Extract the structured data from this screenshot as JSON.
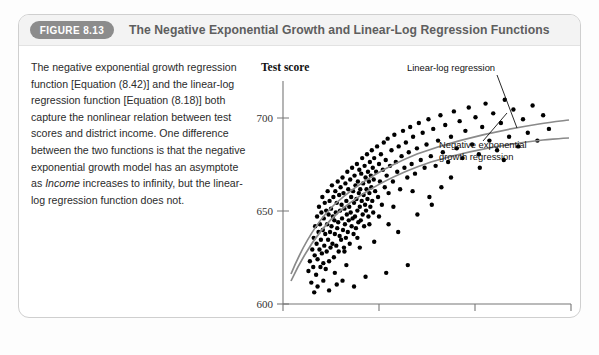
{
  "figure": {
    "badge": "FIGURE 8.13",
    "title": "The Negative Exponential Growth and Linear-Log Regression Functions",
    "caption_text": "The negative exponential growth regression function [Equation (8.42)] and the linear-log regression function [Equation (8.18)] both capture the nonlinear relation between test scores and district income. One difference between the two functions is that the negative exponential growth model has an asymptote as ",
    "caption_italic": "Income",
    "caption_text_2": " increases to infinity, but the linear-log regression function does not."
  },
  "colors": {
    "badge_bg": "#8c8c8c",
    "header_bg": "#f3f3f3",
    "panel_border": "#cfcfcf",
    "point": "#000000",
    "curve": "#8a8a8a",
    "axis": "#555555"
  },
  "chart_data": {
    "type": "scatter",
    "title": "",
    "xlabel": "District income",
    "ylabel": "Test score",
    "xlim": [
      0,
      60
    ],
    "ylim": [
      600,
      710
    ],
    "xticks": [
      0,
      20,
      40,
      60
    ],
    "yticks": [
      600,
      650,
      700
    ],
    "grid": false,
    "legend_position": "in-plot-annotations",
    "annotations": [
      {
        "name": "linear-log-regression",
        "label": "Linear-log regression"
      },
      {
        "name": "negative-exponential-growth-regression",
        "label": "Negative exponential growth regression"
      }
    ],
    "series": [
      {
        "name": "Districts",
        "type": "scatter",
        "points": [
          [
            5.3,
            617
          ],
          [
            5.6,
            622
          ],
          [
            5.9,
            611
          ],
          [
            6.1,
            628
          ],
          [
            6.3,
            619
          ],
          [
            6.4,
            634
          ],
          [
            6.6,
            625
          ],
          [
            6.7,
            640
          ],
          [
            6.9,
            615
          ],
          [
            7.0,
            631
          ],
          [
            7.1,
            645
          ],
          [
            7.2,
            623
          ],
          [
            7.4,
            637
          ],
          [
            7.5,
            650
          ],
          [
            7.6,
            628
          ],
          [
            7.7,
            641
          ],
          [
            7.8,
            619
          ],
          [
            7.9,
            633
          ],
          [
            8.0,
            647
          ],
          [
            8.1,
            626
          ],
          [
            8.2,
            655
          ],
          [
            8.3,
            638
          ],
          [
            8.4,
            621
          ],
          [
            8.5,
            644
          ],
          [
            8.6,
            630
          ],
          [
            8.7,
            652
          ],
          [
            8.8,
            636
          ],
          [
            8.9,
            618
          ],
          [
            9.0,
            648
          ],
          [
            9.1,
            627
          ],
          [
            9.2,
            641
          ],
          [
            9.3,
            658
          ],
          [
            9.4,
            633
          ],
          [
            9.5,
            646
          ],
          [
            9.6,
            622
          ],
          [
            9.7,
            653
          ],
          [
            9.8,
            637
          ],
          [
            9.9,
            629
          ],
          [
            10.0,
            649
          ],
          [
            10.1,
            640
          ],
          [
            10.2,
            661
          ],
          [
            10.3,
            631
          ],
          [
            10.4,
            645
          ],
          [
            10.5,
            655
          ],
          [
            10.6,
            624
          ],
          [
            10.7,
            643
          ],
          [
            10.8,
            636
          ],
          [
            10.9,
            658
          ],
          [
            11.0,
            647
          ],
          [
            11.1,
            630
          ],
          [
            11.2,
            652
          ],
          [
            11.3,
            639
          ],
          [
            11.4,
            663
          ],
          [
            11.5,
            642
          ],
          [
            11.6,
            627
          ],
          [
            11.7,
            656
          ],
          [
            11.8,
            635
          ],
          [
            11.9,
            648
          ],
          [
            12.0,
            660
          ],
          [
            12.1,
            633
          ],
          [
            12.2,
            651
          ],
          [
            12.3,
            644
          ],
          [
            12.4,
            665
          ],
          [
            12.5,
            638
          ],
          [
            12.6,
            657
          ],
          [
            12.7,
            629
          ],
          [
            12.8,
            649
          ],
          [
            12.9,
            641
          ],
          [
            13.0,
            662
          ],
          [
            13.1,
            634
          ],
          [
            13.2,
            653
          ],
          [
            13.3,
            646
          ],
          [
            13.4,
            668
          ],
          [
            13.5,
            637
          ],
          [
            13.6,
            659
          ],
          [
            13.7,
            643
          ],
          [
            13.8,
            650
          ],
          [
            13.9,
            631
          ],
          [
            14.0,
            664
          ],
          [
            14.1,
            647
          ],
          [
            14.2,
            655
          ],
          [
            14.3,
            640
          ],
          [
            14.4,
            670
          ],
          [
            14.5,
            644
          ],
          [
            14.6,
            658
          ],
          [
            14.7,
            636
          ],
          [
            14.8,
            652
          ],
          [
            14.9,
            666
          ],
          [
            15.0,
            645
          ],
          [
            15.1,
            661
          ],
          [
            15.2,
            639
          ],
          [
            15.3,
            654
          ],
          [
            15.4,
            672
          ],
          [
            15.5,
            648
          ],
          [
            15.6,
            663
          ],
          [
            15.7,
            642
          ],
          [
            15.8,
            657
          ],
          [
            15.9,
            669
          ],
          [
            16.0,
            650
          ],
          [
            16.1,
            659
          ],
          [
            16.2,
            643
          ],
          [
            16.3,
            667
          ],
          [
            16.4,
            653
          ],
          [
            16.5,
            675
          ],
          [
            16.6,
            646
          ],
          [
            16.7,
            662
          ],
          [
            16.8,
            656
          ],
          [
            16.9,
            640
          ],
          [
            17.0,
            671
          ],
          [
            17.1,
            651
          ],
          [
            17.2,
            665
          ],
          [
            17.3,
            648
          ],
          [
            17.4,
            659
          ],
          [
            17.5,
            677
          ],
          [
            17.6,
            654
          ],
          [
            17.7,
            668
          ],
          [
            17.8,
            645
          ],
          [
            17.9,
            663
          ],
          [
            18.0,
            657
          ],
          [
            18.1,
            673
          ],
          [
            18.2,
            650
          ],
          [
            18.3,
            666
          ],
          [
            18.4,
            660
          ],
          [
            18.5,
            679
          ],
          [
            18.6,
            653
          ],
          [
            18.7,
            670
          ],
          [
            18.8,
            647
          ],
          [
            18.9,
            664
          ],
          [
            19.0,
            675
          ],
          [
            19.2,
            658
          ],
          [
            19.4,
            668
          ],
          [
            19.6,
            681
          ],
          [
            19.8,
            655
          ],
          [
            20.0,
            672
          ],
          [
            20.2,
            663
          ],
          [
            20.4,
            677
          ],
          [
            20.6,
            651
          ],
          [
            20.8,
            669
          ],
          [
            21.0,
            683
          ],
          [
            21.2,
            660
          ],
          [
            21.4,
            674
          ],
          [
            21.6,
            666
          ],
          [
            21.8,
            685
          ],
          [
            22.0,
            657
          ],
          [
            22.3,
            671
          ],
          [
            22.6,
            679
          ],
          [
            22.9,
            663
          ],
          [
            23.2,
            687
          ],
          [
            23.5,
            673
          ],
          [
            23.8,
            668
          ],
          [
            24.1,
            681
          ],
          [
            24.4,
            659
          ],
          [
            24.7,
            676
          ],
          [
            25.0,
            689
          ],
          [
            25.3,
            670
          ],
          [
            25.6,
            683
          ],
          [
            25.9,
            665
          ],
          [
            26.2,
            678
          ],
          [
            26.5,
            691
          ],
          [
            26.8,
            672
          ],
          [
            27.1,
            686
          ],
          [
            27.5,
            667
          ],
          [
            27.9,
            680
          ],
          [
            28.3,
            693
          ],
          [
            28.7,
            674
          ],
          [
            29.1,
            688
          ],
          [
            29.5,
            670
          ],
          [
            29.9,
            682
          ],
          [
            30.3,
            695
          ],
          [
            30.8,
            676
          ],
          [
            31.3,
            690
          ],
          [
            31.8,
            671
          ],
          [
            32.3,
            684
          ],
          [
            32.8,
            697
          ],
          [
            33.3,
            678
          ],
          [
            33.8,
            692
          ],
          [
            34.4,
            673
          ],
          [
            35.0,
            686
          ],
          [
            35.6,
            699
          ],
          [
            36.2,
            680
          ],
          [
            36.8,
            694
          ],
          [
            37.4,
            675
          ],
          [
            38.0,
            689
          ],
          [
            38.7,
            701
          ],
          [
            39.4,
            682
          ],
          [
            40.1,
            696
          ],
          [
            40.8,
            677
          ],
          [
            41.5,
            691
          ],
          [
            42.2,
            703
          ],
          [
            43.0,
            684
          ],
          [
            43.8,
            698
          ],
          [
            44.6,
            679
          ],
          [
            45.4,
            693
          ],
          [
            46.2,
            705
          ],
          [
            47.1,
            686
          ],
          [
            48.0,
            700
          ],
          [
            49.0,
            681
          ],
          [
            50.0,
            695
          ],
          [
            51.0,
            688
          ],
          [
            52.0,
            702
          ],
          [
            53.0,
            684
          ],
          [
            54.2,
            697
          ],
          [
            55.4,
            690
          ],
          [
            12.4,
            612
          ],
          [
            14.8,
            609
          ],
          [
            9.6,
            607
          ],
          [
            17.2,
            614
          ],
          [
            11.2,
            610
          ],
          [
            21.5,
            616
          ],
          [
            26.0,
            620
          ],
          [
            30.5,
            655
          ],
          [
            33.0,
            660
          ],
          [
            24.0,
            637
          ],
          [
            28.0,
            646
          ],
          [
            19.0,
            632
          ],
          [
            16.0,
            629
          ],
          [
            13.2,
            620
          ],
          [
            10.8,
            616
          ],
          [
            8.4,
            612
          ],
          [
            7.2,
            609
          ],
          [
            6.5,
            606
          ],
          [
            22.0,
            641
          ],
          [
            35.0,
            665
          ],
          [
            41.0,
            670
          ],
          [
            46.0,
            674
          ],
          [
            31.0,
            651
          ],
          [
            27.0,
            658
          ],
          [
            23.0,
            650
          ],
          [
            20.0,
            645
          ],
          [
            18.0,
            641
          ],
          [
            15.5,
            634
          ],
          [
            12.8,
            627
          ]
        ]
      },
      {
        "name": "Linear-log regression",
        "type": "line",
        "description": "Test score = a + b*ln(Income); rises steeply at low income, continues rising without asymptote"
      },
      {
        "name": "Negative exponential growth regression",
        "type": "line",
        "description": "Test score = b0 + b1*(1 - exp(-b2*(Income - b3))); flattens to an asymptote as Income increases"
      }
    ]
  }
}
